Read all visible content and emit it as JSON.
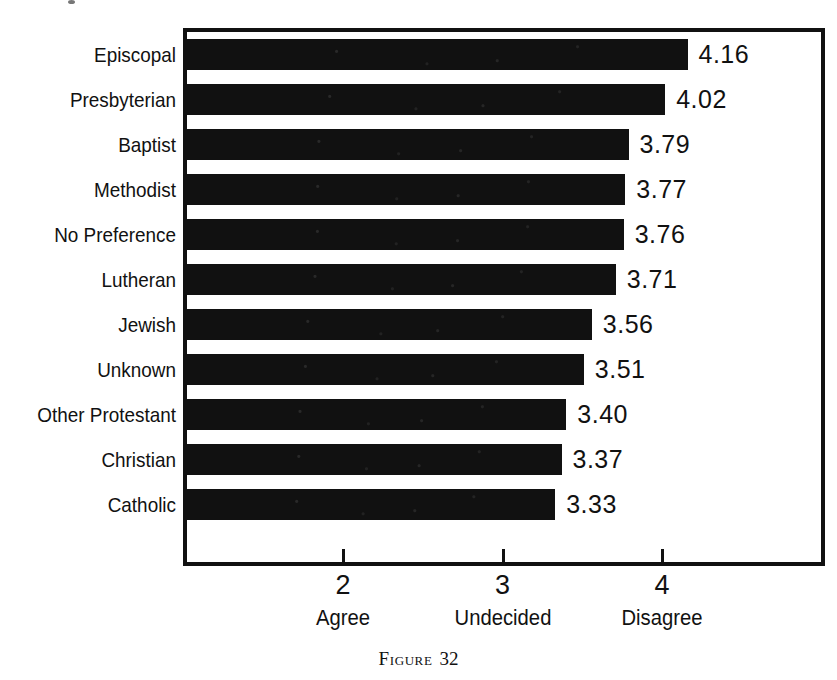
{
  "chart_data": {
    "type": "bar",
    "orientation": "horizontal",
    "title": "",
    "subtitle": "",
    "xlabel": "",
    "ylabel": "",
    "categories": [
      "Episcopal",
      "Presbyterian",
      "Baptist",
      "Methodist",
      "No Preference",
      "Lutheran",
      "Jewish",
      "Unknown",
      "Other Protestant",
      "Christian",
      "Catholic"
    ],
    "values": [
      4.16,
      4.02,
      3.79,
      3.77,
      3.76,
      3.71,
      3.56,
      3.51,
      3.4,
      3.37,
      3.33
    ],
    "value_labels": [
      "4.16",
      "4.02",
      "3.79",
      "3.77",
      "3.76",
      "3.71",
      "3.56",
      "3.51",
      "3.40",
      "3.37",
      "3.33"
    ],
    "xlim": [
      1.02,
      5.04
    ],
    "xticks": [
      2,
      3,
      4
    ],
    "xtick_labels": [
      "2",
      "3",
      "4"
    ],
    "scale_anchors": [
      {
        "value": 2,
        "label": "Agree"
      },
      {
        "value": 3,
        "label": "Undecided"
      },
      {
        "value": 4,
        "label": "Disagree"
      }
    ],
    "grid": false,
    "legend": null,
    "bar_color": "#111111",
    "frame_color": "#111111",
    "background_color": "#ffffff"
  },
  "caption": {
    "prefix": "Figure",
    "number": "32"
  }
}
